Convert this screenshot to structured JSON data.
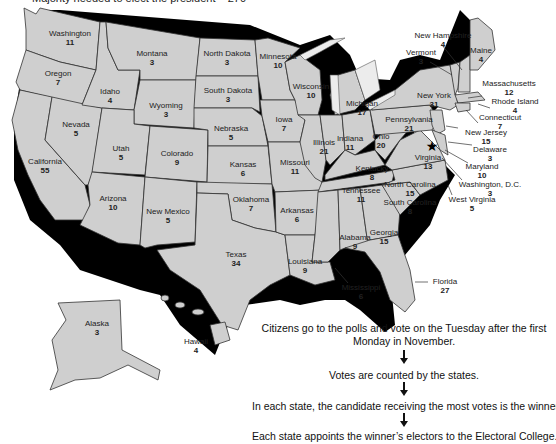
{
  "header": {
    "title": "Majority needed to elect the president – 270"
  },
  "map": {
    "fill_color": "#cfcfcf",
    "border_color": "#333333",
    "capital_marker": "star-icon",
    "states": [
      {
        "name": "Washington",
        "votes": "11"
      },
      {
        "name": "Oregon",
        "votes": "7"
      },
      {
        "name": "California",
        "votes": "55"
      },
      {
        "name": "Nevada",
        "votes": "5"
      },
      {
        "name": "Idaho",
        "votes": "4"
      },
      {
        "name": "Montana",
        "votes": "3"
      },
      {
        "name": "Wyoming",
        "votes": "3"
      },
      {
        "name": "Utah",
        "votes": "5"
      },
      {
        "name": "Arizona",
        "votes": "10"
      },
      {
        "name": "Colorado",
        "votes": "9"
      },
      {
        "name": "New Mexico",
        "votes": "5"
      },
      {
        "name": "North Dakota",
        "votes": "3"
      },
      {
        "name": "South Dakota",
        "votes": "3"
      },
      {
        "name": "Nebraska",
        "votes": "5"
      },
      {
        "name": "Kansas",
        "votes": "6"
      },
      {
        "name": "Oklahoma",
        "votes": "7"
      },
      {
        "name": "Texas",
        "votes": "34"
      },
      {
        "name": "Minnesota",
        "votes": "10"
      },
      {
        "name": "Iowa",
        "votes": "7"
      },
      {
        "name": "Missouri",
        "votes": "11"
      },
      {
        "name": "Arkansas",
        "votes": "6"
      },
      {
        "name": "Louisiana",
        "votes": "9"
      },
      {
        "name": "Wisconsin",
        "votes": "10"
      },
      {
        "name": "Illinois",
        "votes": "21"
      },
      {
        "name": "Michigan",
        "votes": "17"
      },
      {
        "name": "Indiana",
        "votes": "11"
      },
      {
        "name": "Ohio",
        "votes": "20"
      },
      {
        "name": "Kentucky",
        "votes": "8"
      },
      {
        "name": "Tennessee",
        "votes": "11"
      },
      {
        "name": "Mississippi",
        "votes": "6"
      },
      {
        "name": "Alabama",
        "votes": "9"
      },
      {
        "name": "Georgia",
        "votes": "15"
      },
      {
        "name": "Florida",
        "votes": "27"
      },
      {
        "name": "South Carolina",
        "votes": "8"
      },
      {
        "name": "North Carolina",
        "votes": "15"
      },
      {
        "name": "Virginia",
        "votes": "13"
      },
      {
        "name": "West Virginia",
        "votes": "5"
      },
      {
        "name": "Pennsylvania",
        "votes": "21"
      },
      {
        "name": "New York",
        "votes": "31"
      },
      {
        "name": "Vermont",
        "votes": "3"
      },
      {
        "name": "New Hampshire",
        "votes": "4"
      },
      {
        "name": "Maine",
        "votes": "4"
      },
      {
        "name": "Massachusetts",
        "votes": "12"
      },
      {
        "name": "Rhode Island",
        "votes": "4"
      },
      {
        "name": "Connecticut",
        "votes": "7"
      },
      {
        "name": "New Jersey",
        "votes": "15"
      },
      {
        "name": "Delaware",
        "votes": "3"
      },
      {
        "name": "Maryland",
        "votes": "10"
      },
      {
        "name": "Washington, D.C.",
        "votes": "3"
      },
      {
        "name": "Alaska",
        "votes": "3"
      },
      {
        "name": "Hawaii",
        "votes": "4"
      }
    ]
  },
  "flow": {
    "steps": [
      "Citizens go to the polls and vote on the Tuesday after the first",
      "Monday in November.",
      "Votes are counted by the states.",
      "In each state, the candidate receiving the most votes is the winner.",
      "Each state appoints the winner’s electors to the Electoral College."
    ]
  }
}
